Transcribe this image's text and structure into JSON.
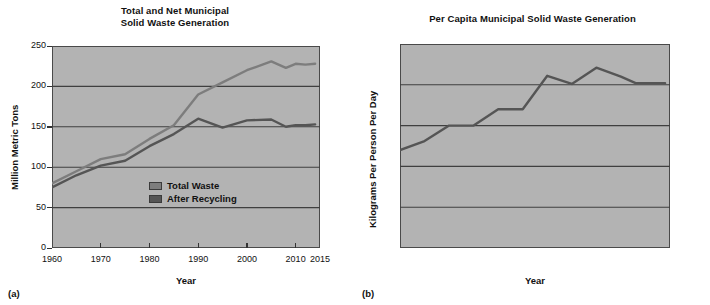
{
  "figure": {
    "panel_a_letter": "(a)",
    "panel_b_letter": "(b)"
  },
  "chart_data": [
    {
      "id": "panel-a",
      "type": "line",
      "title": "Total and Net Municipal Solid Waste Generation",
      "title_line1": "Total and Net Municipal",
      "title_line2": "Solid Waste Generation",
      "xlabel": "Year",
      "ylabel": "Million Metric Tons",
      "xlim": [
        1960,
        2015
      ],
      "ylim": [
        0,
        250
      ],
      "xticks": [
        1960,
        1970,
        1980,
        1990,
        2000,
        2010,
        2015
      ],
      "xticklabels": [
        "1960",
        "1970",
        "1980",
        "1990",
        "2000",
        "2010",
        "2015"
      ],
      "yticks": [
        0,
        50,
        100,
        150,
        200,
        250
      ],
      "yticklabels": [
        "0",
        "50",
        "100",
        "150",
        "200",
        "250"
      ],
      "grid": true,
      "grid_axis": "y",
      "legend_position": "inside-lower-right",
      "plot_background": "#b3b3b3",
      "series": [
        {
          "name": "Total Waste",
          "color": "#7d7d7d",
          "x": [
            1960,
            1965,
            1970,
            1975,
            1980,
            1985,
            1990,
            1995,
            2000,
            2005,
            2008,
            2010,
            2012,
            2014
          ],
          "values": [
            80,
            95,
            110,
            116,
            135,
            152,
            190,
            205,
            220,
            231,
            223,
            228,
            227,
            228
          ]
        },
        {
          "name": "After Recycling",
          "color": "#555555",
          "x": [
            1960,
            1965,
            1970,
            1975,
            1980,
            1985,
            1990,
            1995,
            2000,
            2005,
            2008,
            2010,
            2012,
            2014
          ],
          "values": [
            75,
            90,
            102,
            108,
            126,
            141,
            160,
            149,
            158,
            159,
            150,
            152,
            152,
            153
          ]
        }
      ]
    },
    {
      "id": "panel-b",
      "type": "line",
      "title": "Per Capita Municipal Solid Waste Generation",
      "xlabel": "Year",
      "ylabel": "Kilograms Per Person Per Day",
      "xlim": [
        1960,
        2015
      ],
      "ylim": [
        0,
        2.5
      ],
      "xticks": [
        1960,
        1970,
        1980,
        1990,
        2000,
        2010,
        2015
      ],
      "xticklabels": [
        "1960",
        "1970",
        "1980",
        "1990",
        "2000",
        "2010",
        "2015"
      ],
      "yticks": [
        0,
        0.5,
        1,
        1.5,
        2,
        2.5
      ],
      "yticklabels": [
        "0",
        "0.5",
        "1",
        "1.5",
        "2",
        "2.5"
      ],
      "grid": true,
      "grid_axis": "y",
      "legend_position": "none",
      "plot_background": "#b3b3b3",
      "series": [
        {
          "name": "Per Capita Generation",
          "color": "#555555",
          "x": [
            1960,
            1965,
            1970,
            1975,
            1980,
            1985,
            1990,
            1995,
            2000,
            2005,
            2008,
            2010,
            2014
          ],
          "values": [
            1.2,
            1.31,
            1.5,
            1.5,
            1.7,
            1.7,
            2.11,
            2.01,
            2.21,
            2.1,
            2.02,
            2.02,
            2.02
          ]
        }
      ]
    }
  ]
}
